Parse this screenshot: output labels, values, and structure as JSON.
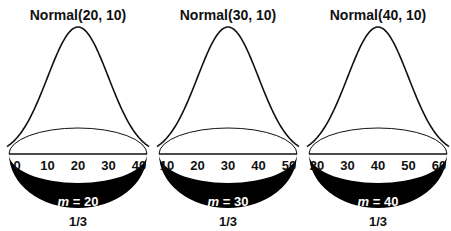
{
  "chart_data": {
    "type": "line",
    "title": "",
    "panels": [
      {
        "title": "Normal(20, 10)",
        "mean": 20,
        "sd": 10,
        "x_ticks": [
          0,
          10,
          20,
          30,
          40
        ],
        "xlim": [
          0,
          40
        ],
        "m_label_var": "m",
        "m_label_rest": " = 20",
        "probability": "1/3"
      },
      {
        "title": "Normal(30, 10)",
        "mean": 30,
        "sd": 10,
        "x_ticks": [
          10,
          20,
          30,
          40,
          50
        ],
        "xlim": [
          10,
          50
        ],
        "m_label_var": "m",
        "m_label_rest": " = 30",
        "probability": "1/3"
      },
      {
        "title": "Normal(40, 10)",
        "mean": 40,
        "sd": 10,
        "x_ticks": [
          20,
          30,
          40,
          50,
          60
        ],
        "xlim": [
          20,
          60
        ],
        "m_label_var": "m",
        "m_label_rest": " = 40",
        "probability": "1/3"
      }
    ],
    "grid": false,
    "legend": null
  },
  "colors": {
    "ink": "#111111",
    "background": "#ffffff",
    "disk_fill": "#000000",
    "m_label": "#ffffff"
  }
}
